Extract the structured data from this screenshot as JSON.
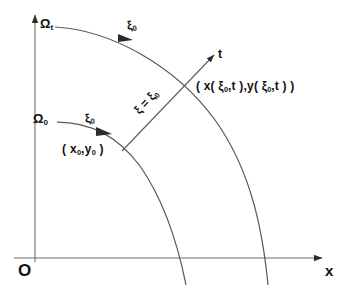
{
  "figure": {
    "caption": "Lagrangian description: material domain mapped from reference configuration to current configuration",
    "background_color": "#ffffff",
    "ink_color": "#2b2b2b",
    "axes": {
      "origin_label": "O",
      "x_axis_label": "x",
      "x_axis_name": "horizontal-axis",
      "y_axis_name": "vertical-axis"
    },
    "labels": {
      "omega_t": "Ω",
      "omega_t_sub": "t",
      "omega_0": "Ω",
      "omega_0_sub": "0",
      "xi_upper": "ξ",
      "xi_upper_sub": "0",
      "xi_lower": "ξ",
      "xi_lower_sub": "0",
      "t_axis": "t",
      "xi_equals": "ξ = ξ",
      "xi_equals_sub": "0",
      "initial_point": "( x",
      "initial_point_sub1": "0",
      "initial_point_mid": ",y",
      "initial_point_sub2": "0",
      "initial_point_end": " )",
      "current_point": "( x( ξ",
      "current_point_sub1": "0",
      "current_point_mid": ",t ),y( ξ",
      "current_point_sub2": "0",
      "current_point_end": ",t ) )"
    },
    "curves": [
      {
        "name": "omega-t-arc",
        "description": "outer arc, current configuration boundary"
      },
      {
        "name": "omega-0-arc",
        "description": "inner arc, reference configuration boundary"
      },
      {
        "name": "xi-constant-trajectory",
        "description": "radial particle path line xi = xi_0 with t arrow"
      }
    ]
  }
}
